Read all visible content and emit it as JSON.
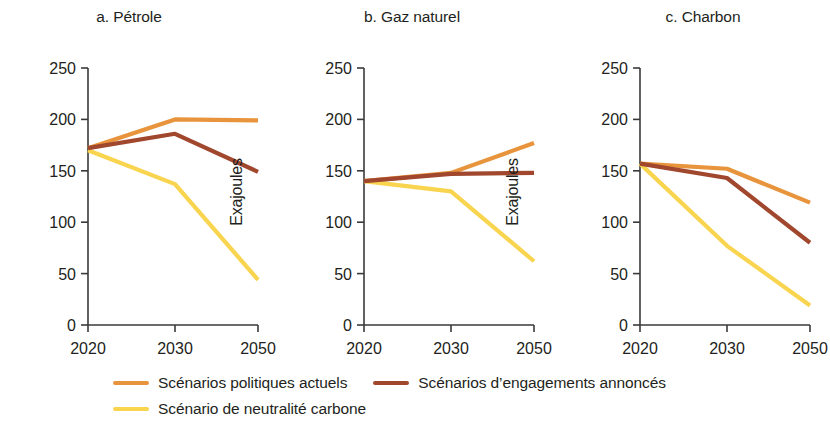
{
  "figure": {
    "ylabel": "Exajoules",
    "yticks": [
      0,
      50,
      100,
      150,
      200,
      250
    ],
    "xticks": [
      "2020",
      "2030",
      "2050"
    ]
  },
  "legend": {
    "items": [
      {
        "label": "Scénarios politiques actuels",
        "color": "#e8943c"
      },
      {
        "label": "Scénarios d’engagements annoncés",
        "color": "#a0472e"
      },
      {
        "label": "Scénario de neutralité carbone",
        "color": "#f9d44f"
      }
    ]
  },
  "panels": [
    {
      "title": "a. Pétrole"
    },
    {
      "title": "b. Gaz naturel"
    },
    {
      "title": "c. Charbon"
    }
  ],
  "chart_data": [
    {
      "type": "line",
      "title": "a. Pétrole",
      "xlabel": "",
      "ylabel": "Exajoules",
      "x": [
        "2020",
        "2030",
        "2050"
      ],
      "ylim": [
        0,
        250
      ],
      "yticks": [
        0,
        50,
        100,
        150,
        200,
        250
      ],
      "grid": false,
      "legend_position": "bottom",
      "series": [
        {
          "name": "Scénarios politiques actuels",
          "color": "#e8943c",
          "values": [
            172,
            200,
            199
          ]
        },
        {
          "name": "Scénarios d’engagements annoncés",
          "color": "#a0472e",
          "values": [
            172,
            186,
            149
          ]
        },
        {
          "name": "Scénario de neutralité carbone",
          "color": "#f9d44f",
          "values": [
            170,
            137,
            44
          ]
        }
      ]
    },
    {
      "type": "line",
      "title": "b. Gaz naturel",
      "xlabel": "",
      "ylabel": "Exajoules",
      "x": [
        "2020",
        "2030",
        "2050"
      ],
      "ylim": [
        0,
        250
      ],
      "yticks": [
        0,
        50,
        100,
        150,
        200,
        250
      ],
      "grid": false,
      "legend_position": "bottom",
      "series": [
        {
          "name": "Scénarios politiques actuels",
          "color": "#e8943c",
          "values": [
            140,
            148,
            177
          ]
        },
        {
          "name": "Scénarios d’engagements annoncés",
          "color": "#a0472e",
          "values": [
            140,
            147,
            148
          ]
        },
        {
          "name": "Scénario de neutralité carbone",
          "color": "#f9d44f",
          "values": [
            140,
            130,
            62
          ]
        }
      ]
    },
    {
      "type": "line",
      "title": "c. Charbon",
      "xlabel": "",
      "ylabel": "Exajoules",
      "x": [
        "2020",
        "2030",
        "2050"
      ],
      "ylim": [
        0,
        250
      ],
      "yticks": [
        0,
        50,
        100,
        150,
        200,
        250
      ],
      "grid": false,
      "legend_position": "bottom",
      "series": [
        {
          "name": "Scénarios politiques actuels",
          "color": "#e8943c",
          "values": [
            157,
            152,
            119
          ]
        },
        {
          "name": "Scénarios d’engagements annoncés",
          "color": "#a0472e",
          "values": [
            157,
            143,
            80
          ]
        },
        {
          "name": "Scénario de neutralité carbone",
          "color": "#f9d44f",
          "values": [
            157,
            77,
            19
          ]
        }
      ]
    }
  ]
}
